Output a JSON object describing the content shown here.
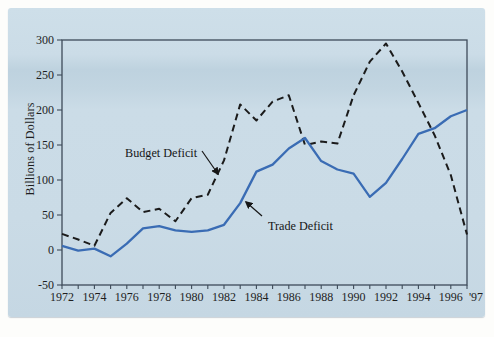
{
  "window": {
    "background": "#fdfdfb"
  },
  "panel": {
    "background": "#cadbe7",
    "band_color": "#bed2df"
  },
  "chart_data": {
    "type": "line",
    "title": "",
    "ylabel": "Billions of Dollars",
    "xlabel": "",
    "ylim": [
      -50,
      300
    ],
    "yticks": [
      -50,
      0,
      50,
      100,
      150,
      200,
      250,
      300
    ],
    "xlim": [
      1972,
      1997
    ],
    "xticks": [
      {
        "year": 1972,
        "label": "1972"
      },
      {
        "year": 1974,
        "label": "1974"
      },
      {
        "year": 1976,
        "label": "1976"
      },
      {
        "year": 1978,
        "label": "1978"
      },
      {
        "year": 1980,
        "label": "1980"
      },
      {
        "year": 1982,
        "label": "1982"
      },
      {
        "year": 1984,
        "label": "1984"
      },
      {
        "year": 1986,
        "label": "1986"
      },
      {
        "year": 1988,
        "label": "1988"
      },
      {
        "year": 1990,
        "label": "1990"
      },
      {
        "year": 1992,
        "label": "1992"
      },
      {
        "year": 1994,
        "label": "1994"
      },
      {
        "year": 1996,
        "label": "1996"
      },
      {
        "year": 1997,
        "label": "'97",
        "dx": 9
      }
    ],
    "grid": false,
    "legend_position": "inline-annotations",
    "frame_color": "#3e4b59",
    "text_color": "#1e1e1e",
    "x": [
      1972,
      1973,
      1974,
      1975,
      1976,
      1977,
      1978,
      1979,
      1980,
      1981,
      1982,
      1983,
      1984,
      1985,
      1986,
      1987,
      1988,
      1989,
      1990,
      1991,
      1992,
      1993,
      1994,
      1995,
      1996,
      1997
    ],
    "series": [
      {
        "name": "Budget Deficit",
        "color": "#1b1b1b",
        "style": "dashed",
        "width": 2,
        "values": [
          23,
          15,
          6,
          53,
          74,
          54,
          59,
          41,
          74,
          79,
          128,
          208,
          185,
          212,
          221,
          150,
          155,
          152,
          221,
          269,
          295,
          255,
          210,
          164,
          107,
          22
        ]
      },
      {
        "name": "Trade Deficit",
        "color": "#3a6cb4",
        "style": "solid",
        "width": 2.3,
        "values": [
          6,
          -1,
          2,
          -9,
          9,
          31,
          34,
          28,
          26,
          28,
          36,
          67,
          112,
          122,
          145,
          160,
          127,
          115,
          109,
          76,
          96,
          130,
          166,
          174,
          191,
          200
        ]
      }
    ],
    "annotations": [
      {
        "text": "Budget Deficit",
        "series": "Budget Deficit",
        "arrow_px": [
          194,
          143,
          210,
          166
        ]
      },
      {
        "text": "Trade Deficit",
        "series": "Trade Deficit",
        "arrow_px": [
          254,
          208,
          238,
          194
        ]
      }
    ]
  }
}
